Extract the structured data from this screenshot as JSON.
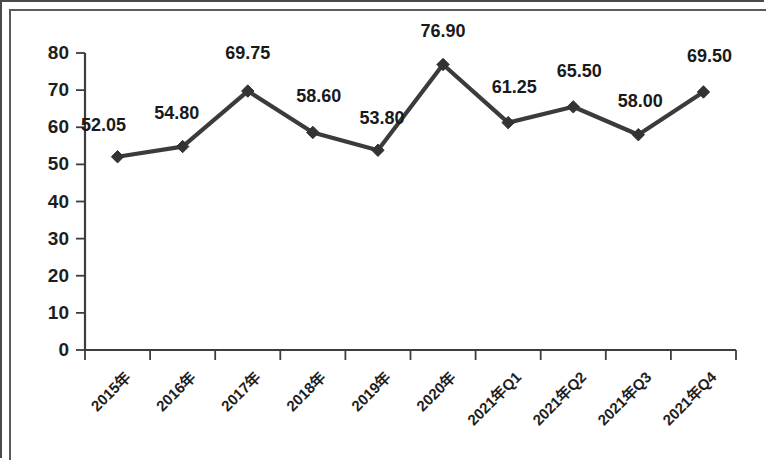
{
  "chart_data": {
    "type": "line",
    "title": "",
    "xlabel": "",
    "ylabel": "",
    "ylim": [
      0,
      80
    ],
    "ytick_step": 10,
    "grid": false,
    "legend": "none",
    "line_color": "#3b3b3b",
    "marker": "diamond",
    "categories": [
      "2015年",
      "2016年",
      "2017年",
      "2018年",
      "2019年",
      "2020年",
      "2021年Q1",
      "2021年Q2",
      "2021年Q3",
      "2021年Q4"
    ],
    "values": [
      52.05,
      54.8,
      69.75,
      58.6,
      53.8,
      76.9,
      61.25,
      65.5,
      58.0,
      69.5
    ],
    "point_labels": [
      "52.05",
      "54.80",
      "69.75",
      "58.60",
      "53.80",
      "76.90",
      "61.25",
      "65.50",
      "58.00",
      "69.50"
    ],
    "ytick_labels": [
      "0",
      "10",
      "20",
      "30",
      "40",
      "50",
      "60",
      "70",
      "80"
    ],
    "ytick_values": [
      0,
      10,
      20,
      30,
      40,
      50,
      60,
      70,
      80
    ]
  }
}
